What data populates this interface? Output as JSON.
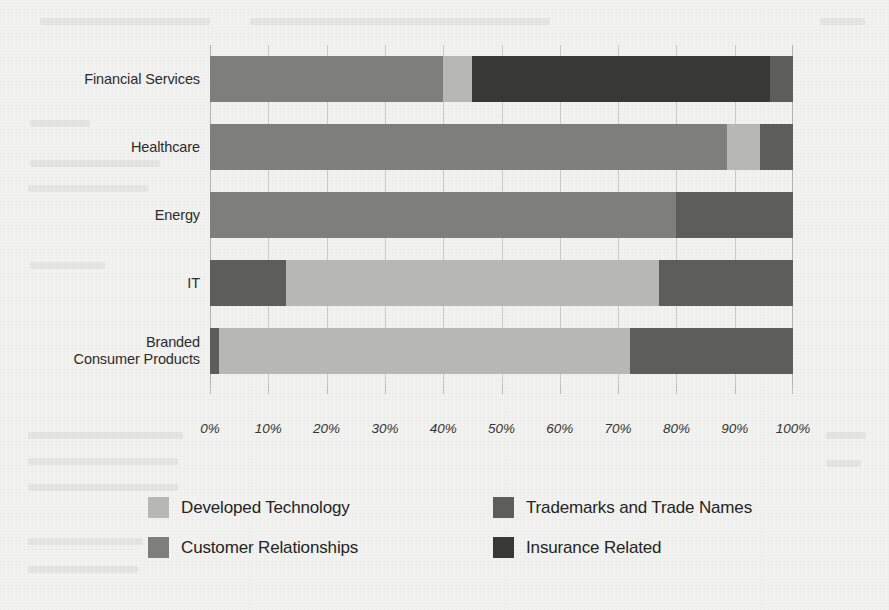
{
  "chart_data": {
    "type": "bar",
    "orientation": "horizontal",
    "stacked": true,
    "normalized": true,
    "title": "",
    "subtitle": "",
    "xlabel": "",
    "ylabel": "",
    "xlim": [
      0,
      100
    ],
    "grid": true,
    "legend_position": "bottom",
    "xtick_labels": [
      "0%",
      "10%",
      "20%",
      "30%",
      "40%",
      "50%",
      "60%",
      "70%",
      "80%",
      "90%",
      "100%"
    ],
    "xtick_values": [
      0,
      10,
      20,
      30,
      40,
      50,
      60,
      70,
      80,
      90,
      100
    ],
    "categories": [
      "Financial Services",
      "Healthcare",
      "Energy",
      "IT",
      "Branded\nConsumer Products"
    ],
    "category_lines": [
      [
        "Financial Services"
      ],
      [
        "Healthcare"
      ],
      [
        "Energy"
      ],
      [
        "IT"
      ],
      [
        "Branded",
        "Consumer Products"
      ]
    ],
    "series": [
      {
        "name": "Developed Technology",
        "color": "#b7b7b5",
        "values": [
          5.0,
          5.6,
          0.0,
          64.0,
          70.5
        ]
      },
      {
        "name": "Customer Relationships",
        "color": "#7e7e7c",
        "values": [
          40.0,
          88.7,
          80.0,
          0.0,
          0.0
        ]
      },
      {
        "name": "Trademarks and Trade Names",
        "color": "#5d5d5b",
        "values": [
          4.0,
          5.7,
          20.0,
          36.0,
          29.5
        ]
      },
      {
        "name": "Insurance Related",
        "color": "#383836",
        "values": [
          51.0,
          0.0,
          0.0,
          0.0,
          0.0
        ]
      }
    ],
    "stacks": [
      {
        "category": "Financial Services",
        "segments": [
          {
            "series": "Customer Relationships",
            "start": 0.0,
            "end": 40.0,
            "value": 40.0,
            "color": "#7e7e7c"
          },
          {
            "series": "Developed Technology",
            "start": 40.0,
            "end": 45.0,
            "value": 5.0,
            "color": "#b7b7b5"
          },
          {
            "series": "Insurance Related",
            "start": 45.0,
            "end": 96.0,
            "value": 51.0,
            "color": "#383836"
          },
          {
            "series": "Trademarks and Trade Names",
            "start": 96.0,
            "end": 100.0,
            "value": 4.0,
            "color": "#5d5d5b"
          }
        ]
      },
      {
        "category": "Healthcare",
        "segments": [
          {
            "series": "Customer Relationships",
            "start": 0.0,
            "end": 88.7,
            "value": 88.7,
            "color": "#7e7e7c"
          },
          {
            "series": "Developed Technology",
            "start": 88.7,
            "end": 94.3,
            "value": 5.6,
            "color": "#b7b7b5"
          },
          {
            "series": "Trademarks and Trade Names",
            "start": 94.3,
            "end": 100.0,
            "value": 5.7,
            "color": "#5d5d5b"
          }
        ]
      },
      {
        "category": "Energy",
        "segments": [
          {
            "series": "Customer Relationships",
            "start": 0.0,
            "end": 80.0,
            "value": 80.0,
            "color": "#7e7e7c"
          },
          {
            "series": "Trademarks and Trade Names",
            "start": 80.0,
            "end": 100.0,
            "value": 20.0,
            "color": "#5d5d5b"
          }
        ]
      },
      {
        "category": "IT",
        "segments": [
          {
            "series": "Trademarks and Trade Names",
            "start": 0.0,
            "end": 13.0,
            "value": 13.0,
            "color": "#5d5d5b"
          },
          {
            "series": "Developed Technology",
            "start": 13.0,
            "end": 77.0,
            "value": 64.0,
            "color": "#b7b7b5"
          },
          {
            "series": "Trademarks and Trade Names",
            "start": 77.0,
            "end": 100.0,
            "value": 23.0,
            "color": "#5d5d5b"
          }
        ]
      },
      {
        "category": "Branded Consumer Products",
        "segments": [
          {
            "series": "Trademarks and Trade Names",
            "start": 0.0,
            "end": 1.5,
            "value": 1.5,
            "color": "#5d5d5b"
          },
          {
            "series": "Developed Technology",
            "start": 1.5,
            "end": 72.0,
            "value": 70.5,
            "color": "#b7b7b5"
          },
          {
            "series": "Trademarks and Trade Names",
            "start": 72.0,
            "end": 100.0,
            "value": 28.0,
            "color": "#5d5d5b"
          }
        ]
      }
    ],
    "legend": [
      {
        "label": "Developed Technology",
        "color": "#b7b7b5",
        "col": 0,
        "row": 0
      },
      {
        "label": "Trademarks and Trade Names",
        "color": "#5d5d5b",
        "col": 1,
        "row": 0
      },
      {
        "label": "Customer Relationships",
        "color": "#7e7e7c",
        "col": 0,
        "row": 1
      },
      {
        "label": "Insurance Related",
        "color": "#383836",
        "col": 1,
        "row": 1
      }
    ]
  },
  "colors": {
    "background": "#f2f2f0",
    "gridline": "#c9c9c7",
    "text": "#2c2c2c",
    "developed_technology": "#b7b7b5",
    "customer_relationships": "#7e7e7c",
    "trademarks_and_trade_names": "#5d5d5b",
    "insurance_related": "#383836"
  }
}
